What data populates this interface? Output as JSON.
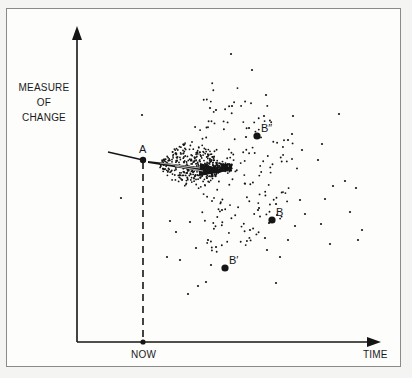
{
  "figure": {
    "y_axis_label": [
      "MEASURE",
      "OF",
      "CHANGE"
    ],
    "x_axis_label": "TIME",
    "now_label": "NOW",
    "points": [
      {
        "name": "A",
        "label": "A",
        "x": 143,
        "y": 160
      },
      {
        "name": "B",
        "label": "B",
        "x": 272,
        "y": 220
      },
      {
        "name": "B-prime",
        "label": "B′",
        "x": 225,
        "y": 268
      },
      {
        "name": "B-double-prime",
        "label": "B″",
        "x": 257,
        "y": 136
      }
    ],
    "colors": {
      "ink": "#151515",
      "background": "#fdfdfc",
      "border": "#8a8a8a"
    }
  },
  "chart_data": {
    "type": "scatter",
    "title": "",
    "xlabel": "TIME",
    "ylabel": "MEASURE OF CHANGE",
    "x_marker": "NOW",
    "annotations": [
      "A",
      "B",
      "B'",
      "B''"
    ],
    "cloud": {
      "origin": [
        150,
        162
      ],
      "direction_end": [
        232,
        172
      ],
      "dense_count": 520,
      "sparse_count": 150,
      "seed": 7
    },
    "outliers": [
      [
        231,
        54
      ],
      [
        252,
        70
      ],
      [
        266,
        95
      ],
      [
        210,
        108
      ],
      [
        232,
        106
      ],
      [
        142,
        115
      ],
      [
        216,
        110
      ],
      [
        264,
        116
      ],
      [
        293,
        116
      ],
      [
        339,
        114
      ],
      [
        249,
        128
      ],
      [
        246,
        137
      ],
      [
        292,
        134
      ],
      [
        288,
        140
      ],
      [
        302,
        150
      ],
      [
        322,
        144
      ],
      [
        318,
        160
      ],
      [
        333,
        186
      ],
      [
        325,
        199
      ],
      [
        305,
        214
      ],
      [
        321,
        224
      ],
      [
        345,
        181
      ],
      [
        356,
        188
      ],
      [
        350,
        212
      ],
      [
        300,
        200
      ],
      [
        295,
        226
      ],
      [
        330,
        244
      ],
      [
        362,
        230
      ],
      [
        358,
        240
      ],
      [
        269,
        223
      ],
      [
        288,
        240
      ],
      [
        265,
        238
      ],
      [
        276,
        204
      ],
      [
        258,
        210
      ],
      [
        180,
        260
      ],
      [
        167,
        257
      ],
      [
        176,
        232
      ],
      [
        121,
        198
      ],
      [
        170,
        221
      ],
      [
        190,
        222
      ],
      [
        211,
        265
      ],
      [
        216,
        247
      ],
      [
        196,
        248
      ],
      [
        206,
        282
      ],
      [
        198,
        286
      ],
      [
        208,
        240
      ],
      [
        188,
        294
      ],
      [
        267,
        250
      ],
      [
        276,
        283
      ],
      [
        259,
        208
      ],
      [
        280,
        257
      ],
      [
        222,
        210
      ],
      [
        250,
        230
      ]
    ]
  }
}
